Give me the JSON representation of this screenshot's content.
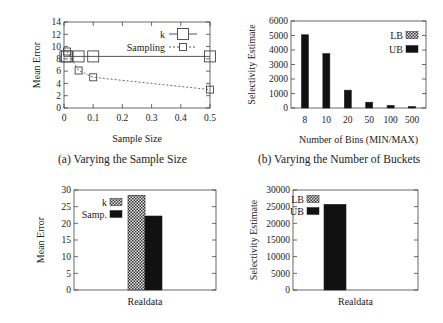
{
  "captions": {
    "a": "(a) Varying the Sample Size",
    "b": "(b) Varying the Number of Buckets"
  },
  "chart_data": [
    {
      "id": "a",
      "type": "line",
      "title": "",
      "xlabel": "Sample Size",
      "ylabel": "Mean Error",
      "xlim": [
        0,
        0.5
      ],
      "ylim": [
        0,
        14
      ],
      "xticks": [
        "0",
        "0.1",
        "0.2",
        "0.3",
        "0.4",
        "0.5"
      ],
      "yticks": [
        "0",
        "2",
        "4",
        "6",
        "8",
        "10",
        "12",
        "14"
      ],
      "grid": false,
      "legend_position": "upper right",
      "series": [
        {
          "name": "k",
          "style": "solid",
          "marker": "large-square",
          "x": [
            0.005,
            0.01,
            0.05,
            0.1,
            0.5
          ],
          "y": [
            8.4,
            8.4,
            8.4,
            8.4,
            8.4
          ]
        },
        {
          "name": "Sampling",
          "style": "dashed",
          "marker": "small-square",
          "x": [
            0.01,
            0.05,
            0.1,
            0.5
          ],
          "y": [
            9.2,
            6.1,
            5.0,
            3.0
          ]
        }
      ]
    },
    {
      "id": "b",
      "type": "bar",
      "title": "",
      "xlabel": "Number of Bins (MIN/MAX)",
      "ylabel": "Selectivity Estimate",
      "categories": [
        "8",
        "10",
        "20",
        "50",
        "100",
        "500"
      ],
      "ylim": [
        0,
        6000
      ],
      "yticks": [
        "0",
        "1000",
        "2000",
        "3000",
        "4000",
        "5000",
        "6000"
      ],
      "grid": false,
      "legend_position": "upper right",
      "series": [
        {
          "name": "LB",
          "pattern": "checker",
          "values": [
            0,
            0,
            0,
            0,
            0,
            0
          ]
        },
        {
          "name": "UB",
          "pattern": "solid",
          "values": [
            5050,
            3750,
            1230,
            400,
            180,
            100
          ]
        }
      ]
    },
    {
      "id": "c",
      "type": "bar",
      "title": "",
      "xlabel": "Realdata",
      "ylabel": "Mean Error",
      "categories": [
        "Realdata"
      ],
      "ylim": [
        0,
        30
      ],
      "yticks": [
        "0",
        "5",
        "10",
        "15",
        "20",
        "25",
        "30"
      ],
      "grid": false,
      "legend_position": "upper left",
      "series": [
        {
          "name": "k",
          "pattern": "checker",
          "values": [
            28.4
          ]
        },
        {
          "name": "Samp.",
          "pattern": "solid",
          "values": [
            22.2
          ]
        }
      ]
    },
    {
      "id": "d",
      "type": "bar",
      "title": "",
      "xlabel": "Realdata",
      "ylabel": "Selectivity Estimate",
      "categories": [
        "Realdata"
      ],
      "ylim": [
        0,
        30000
      ],
      "yticks": [
        "0",
        "5000",
        "10000",
        "15000",
        "20000",
        "25000",
        "30000"
      ],
      "grid": false,
      "legend_position": "upper left",
      "series": [
        {
          "name": "LB",
          "pattern": "checker",
          "values": [
            0
          ]
        },
        {
          "name": "UB",
          "pattern": "solid",
          "values": [
            25700
          ]
        }
      ]
    }
  ]
}
